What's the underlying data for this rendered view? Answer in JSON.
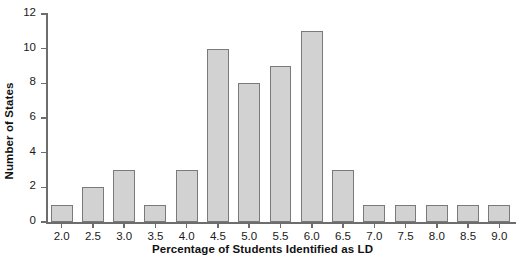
{
  "chart_data": {
    "type": "bar",
    "title": "",
    "xlabel": "Percentage of Students Identified as LD",
    "ylabel": "Number of States",
    "categories": [
      "2.0",
      "2.5",
      "3.0",
      "3.5",
      "4.0",
      "4.5",
      "5.0",
      "5.5",
      "6.0",
      "6.5",
      "7.0",
      "7.5",
      "8.0",
      "8.5",
      "9.0"
    ],
    "values": [
      1,
      2,
      3,
      1,
      3,
      10,
      8,
      9,
      11,
      3,
      1,
      1,
      1,
      1,
      1
    ],
    "ylim": [
      0,
      12
    ],
    "yticks": [
      0,
      2,
      4,
      6,
      8,
      10,
      12
    ],
    "xlim": [
      1.75,
      9.25
    ],
    "grid": false,
    "legend": false,
    "bar_color": "#d2d2d2",
    "bar_edge_color": "#7a7a7a",
    "axis_color": "#6d6d6d",
    "text_color": "#1a1a1a"
  }
}
